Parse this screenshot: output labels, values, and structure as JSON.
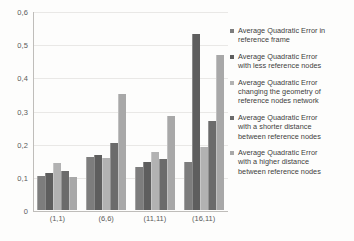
{
  "chart_data": {
    "type": "bar",
    "title": "",
    "xlabel": "",
    "ylabel": "",
    "ylim": [
      0,
      0.6
    ],
    "ytick_values": [
      0,
      0.1,
      0.2,
      0.3,
      0.4,
      0.5,
      0.6
    ],
    "ytick_labels": [
      "0",
      "0,1",
      "0,2",
      "0,3",
      "0,4",
      "0,5",
      "0,6"
    ],
    "grid": true,
    "legend_position": "right",
    "categories": [
      "(1,1)",
      "(6,6)",
      "(11,11)",
      "(16,11)"
    ],
    "series": [
      {
        "name": "Average Quadratic Error in reference frame",
        "color": "#7d7d7d",
        "values": [
          0.104,
          0.161,
          0.129,
          0.145
        ]
      },
      {
        "name": "Average Quadratic Error with less reference nodes",
        "color": "#5e5e5e",
        "values": [
          0.111,
          0.165,
          0.146,
          0.531
        ]
      },
      {
        "name": "Average Quadratic Error changing the geometry of reference nodes network",
        "color": "#b2b2b2",
        "values": [
          0.141,
          0.157,
          0.174,
          0.191
        ]
      },
      {
        "name": "Average Quadratic Error with a shorter distance between reference nodes",
        "color": "#6b6b6b",
        "values": [
          0.117,
          0.202,
          0.155,
          0.269
        ]
      },
      {
        "name": "Average Quadratic Error with a higher distance between reference nodes",
        "color": "#a8a8a8",
        "values": [
          0.099,
          0.349,
          0.283,
          0.466
        ]
      }
    ]
  },
  "legend": {
    "items": [
      {
        "lines": [
          "Average Quadratic Error in",
          "reference frame"
        ],
        "color": "#7d7d7d"
      },
      {
        "lines": [
          "Average Quadratic Error",
          "with less reference nodes"
        ],
        "color": "#5e5e5e"
      },
      {
        "lines": [
          "Average Quadratic Error",
          "changing the geometry of",
          "reference nodes network"
        ],
        "color": "#b2b2b2"
      },
      {
        "lines": [
          "Average Quadratic Error",
          "with a shorter distance",
          "between reference nodes"
        ],
        "color": "#6b6b6b"
      },
      {
        "lines": [
          "Average Quadratic Error",
          "with a higher distance",
          "between reference nodes"
        ],
        "color": "#a8a8a8"
      }
    ]
  }
}
